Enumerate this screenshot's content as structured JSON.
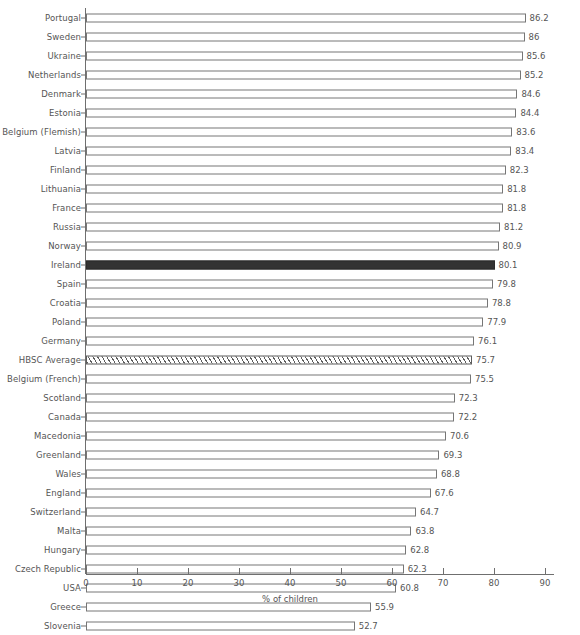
{
  "chart_data": {
    "type": "bar",
    "orientation": "horizontal",
    "title": "",
    "subtitle": "",
    "xlabel": "% of children",
    "ylabel": "",
    "xlim": [
      0,
      90
    ],
    "xticks": [
      0,
      10,
      20,
      30,
      40,
      50,
      60,
      70,
      80,
      90
    ],
    "xtick_labels": [
      "0",
      "10",
      "20",
      "30",
      "40",
      "50",
      "60",
      "70",
      "80",
      "90"
    ],
    "grid": false,
    "legend": "none",
    "value_labels": true,
    "categories": [
      "Portugal",
      "Sweden",
      "Ukraine",
      "Netherlands",
      "Denmark",
      "Estonia",
      "Belgium (Flemish)",
      "Latvia",
      "Finland",
      "Lithuania",
      "France",
      "Russia",
      "Norway",
      "Ireland",
      "Spain",
      "Croatia",
      "Poland",
      "Germany",
      "HBSC Average",
      "Belgium (French)",
      "Scotland",
      "Canada",
      "Macedonia",
      "Greenland",
      "Wales",
      "England",
      "Switzerland",
      "Malta",
      "Hungary",
      "Czech Republic",
      "USA",
      "Greece",
      "Slovenia"
    ],
    "values": [
      86.2,
      86,
      85.6,
      85.2,
      84.6,
      84.4,
      83.6,
      83.4,
      82.3,
      81.8,
      81.8,
      81.2,
      80.9,
      80.1,
      79.8,
      78.8,
      77.9,
      76.1,
      75.7,
      75.5,
      72.3,
      72.2,
      70.6,
      69.3,
      68.8,
      67.6,
      64.7,
      63.8,
      62.8,
      62.3,
      60.8,
      55.9,
      52.7
    ],
    "value_label_texts": [
      "86.2",
      "86",
      "85.6",
      "85.2",
      "84.6",
      "84.4",
      "83.6",
      "83.4",
      "82.3",
      "81.8",
      "81.8",
      "81.2",
      "80.9",
      "80.1",
      "79.8",
      "78.8",
      "77.9",
      "76.1",
      "75.7",
      "75.5",
      "72.3",
      "72.2",
      "70.6",
      "69.3",
      "68.8",
      "67.6",
      "64.7",
      "63.8",
      "62.8",
      "62.3",
      "60.8",
      "55.9",
      "52.7"
    ],
    "styles": [
      "plain",
      "plain",
      "plain",
      "plain",
      "plain",
      "plain",
      "plain",
      "plain",
      "plain",
      "plain",
      "plain",
      "plain",
      "plain",
      "highlight",
      "plain",
      "plain",
      "plain",
      "plain",
      "average",
      "plain",
      "plain",
      "plain",
      "plain",
      "plain",
      "plain",
      "plain",
      "plain",
      "plain",
      "plain",
      "plain",
      "plain",
      "plain",
      "plain"
    ]
  },
  "colors": {
    "background": "#ffffff",
    "bar_fill": "#ffffff",
    "bar_border": "#767676",
    "highlight_fill": "#333333",
    "hatch_stroke": "#5d5d5d",
    "axis": "#6f6f6f",
    "text": "#555555"
  }
}
